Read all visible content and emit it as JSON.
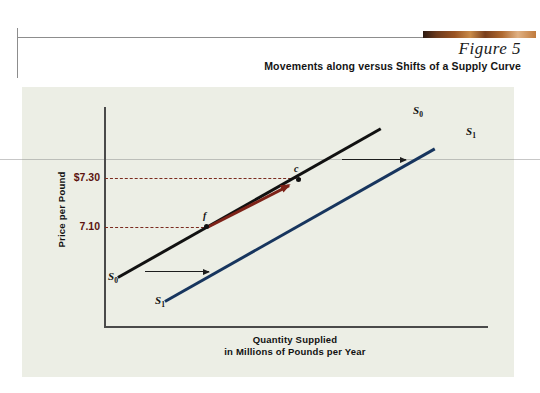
{
  "header": {
    "figure_number": "Figure 5",
    "title": "Movements along versus Shifts of a Supply Curve",
    "accent_bar_color": "#9a5322"
  },
  "chart_data": {
    "type": "line",
    "title": "Movements along versus Shifts of a Supply Curve",
    "xlabel_line1": "Quantity Supplied",
    "xlabel_line2": "in Millions of Pounds per Year",
    "ylabel": "Price per Pound",
    "grid": false,
    "legend_position": "inline-curve-ends",
    "ytick_labels": [
      "$7.30",
      "7.10"
    ],
    "ytick_values": [
      7.3,
      7.1
    ],
    "series": [
      {
        "name": "S0",
        "label": "S",
        "subscript": "0",
        "color": "#111111",
        "label_top": "S0",
        "label_bottom": "S0"
      },
      {
        "name": "S1",
        "label": "S",
        "subscript": "1",
        "color": "#17355e",
        "label_top": "S1",
        "label_bottom": "S1"
      }
    ],
    "points": [
      {
        "id": "f",
        "label": "f",
        "price": 7.1,
        "on_curve": "S0"
      },
      {
        "id": "c",
        "label": "c",
        "price": 7.3,
        "on_curve": "S0"
      }
    ],
    "annotations": [
      {
        "name": "movement-along-curve-arrow",
        "from": "f",
        "to": "c",
        "color": "#7d2218",
        "meaning": "movement along the supply curve"
      },
      {
        "name": "shift-arrow-upper",
        "color": "#1d1d1d",
        "meaning": "rightward shift of supply curve"
      },
      {
        "name": "shift-arrow-lower",
        "color": "#1d1d1d",
        "meaning": "rightward shift of supply curve"
      }
    ],
    "dashed_guides": [
      {
        "name": "guide-7-30",
        "value": 7.3,
        "color": "#7a2a1e"
      },
      {
        "name": "guide-7-10",
        "value": 7.1,
        "color": "#7a2a1e"
      }
    ],
    "panel_background": "#eceee5"
  }
}
